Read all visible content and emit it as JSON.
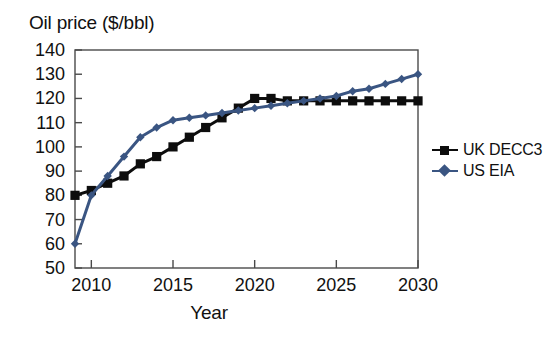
{
  "chart_data": {
    "type": "line",
    "title": "",
    "xlabel": "Year",
    "ylabel": "Oil price ($/bbl)",
    "xlim": [
      2009,
      2030
    ],
    "ylim": [
      50,
      140
    ],
    "xticks": [
      2010,
      2015,
      2020,
      2025,
      2030
    ],
    "yticks": [
      50,
      60,
      70,
      80,
      90,
      100,
      110,
      120,
      130,
      140
    ],
    "grid": false,
    "legend_position": "right",
    "x": [
      2009,
      2010,
      2011,
      2012,
      2013,
      2014,
      2015,
      2016,
      2017,
      2018,
      2019,
      2020,
      2021,
      2022,
      2023,
      2024,
      2025,
      2026,
      2027,
      2028,
      2029,
      2030
    ],
    "series": [
      {
        "name": "UK DECC3",
        "color": "#0d0d0d",
        "marker": "square",
        "values": [
          80,
          82,
          85,
          88,
          93,
          96,
          100,
          104,
          108,
          112,
          116,
          120,
          120,
          119,
          119,
          119,
          119,
          119,
          119,
          119,
          119,
          119
        ]
      },
      {
        "name": "US EIA",
        "color": "#3a5582",
        "marker": "diamond",
        "values": [
          60,
          80,
          88,
          96,
          104,
          108,
          111,
          112,
          113,
          114,
          115,
          116,
          117,
          118,
          119,
          120,
          121,
          123,
          124,
          126,
          128,
          130
        ]
      }
    ]
  },
  "ylabel": {
    "text": "Oil price ($/bbl)"
  },
  "xlabel": {
    "text": "Year"
  },
  "legend": {
    "items": [
      {
        "label": "UK DECC3",
        "color": "#0d0d0d",
        "marker": "square"
      },
      {
        "label": "US EIA",
        "color": "#3a5582",
        "marker": "diamond"
      }
    ]
  },
  "axis": {
    "ytick_labels": [
      "140",
      "130",
      "120",
      "110",
      "100",
      "90",
      "80",
      "70",
      "60",
      "50"
    ],
    "xtick_labels": [
      "2010",
      "2015",
      "2020",
      "2025",
      "2030"
    ]
  }
}
